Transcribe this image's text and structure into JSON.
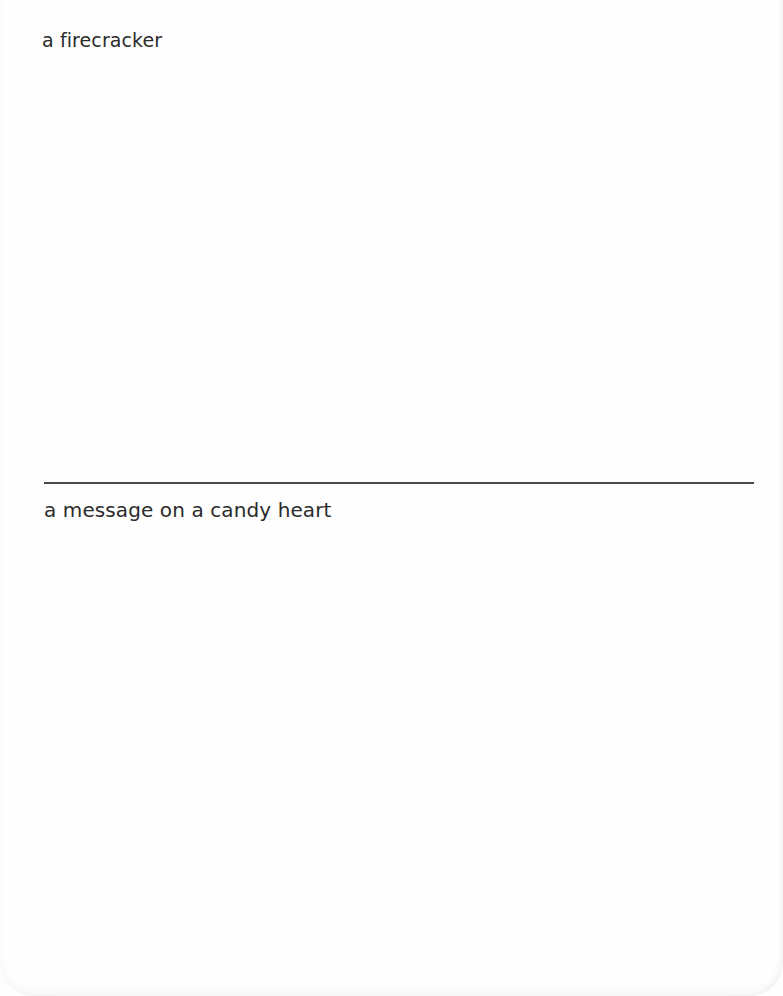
{
  "card": {
    "top_section": {
      "prompt": "a firecracker"
    },
    "bottom_section": {
      "prompt": "a message on a candy heart"
    },
    "colors": {
      "background": "#fefefe",
      "text": "#2b2b2b",
      "divider": "#4a4a4a"
    }
  }
}
